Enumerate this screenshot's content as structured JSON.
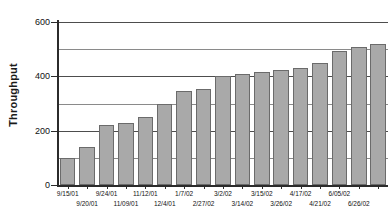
{
  "chart_data": {
    "type": "bar",
    "title": "",
    "xlabel": "",
    "ylabel": "Throughput",
    "ylim": [
      0,
      600
    ],
    "ytick_labels": [
      "0",
      "200",
      "400",
      "600"
    ],
    "yticks": [
      0,
      200,
      400,
      600
    ],
    "gridlines": [
      100,
      200,
      300,
      400,
      500,
      600
    ],
    "grid": true,
    "legend": null,
    "bar_color": "#a9a9a9",
    "bar_border_color": "#6b6b6b",
    "categories": [
      "9/15/01",
      "9/20/01",
      "9/24/01",
      "11/09/01",
      "11/12/01",
      "12/4/01",
      "1/7/02",
      "2/27/02",
      "3/2/02",
      "3/14/02",
      "3/15/02",
      "3/26/02",
      "4/17/02",
      "4/21/02",
      "6/05/02",
      "6/26/02",
      ""
    ],
    "values": [
      100,
      140,
      220,
      230,
      250,
      300,
      345,
      355,
      400,
      407,
      415,
      425,
      432,
      448,
      495,
      508,
      518
    ],
    "label_rows": [
      "top",
      "bottom",
      "top",
      "bottom",
      "top",
      "bottom",
      "top",
      "bottom",
      "top",
      "bottom",
      "top",
      "bottom",
      "top",
      "bottom",
      "top",
      "bottom",
      "top"
    ]
  }
}
